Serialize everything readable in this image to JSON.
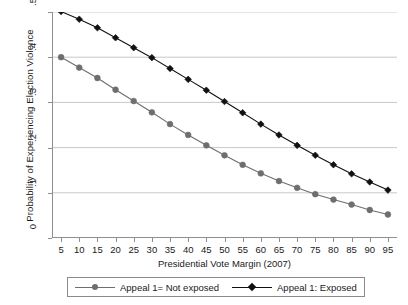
{
  "chart_data": {
    "type": "line",
    "title": "",
    "xlabel": "Presidential Vote Margin (2007)",
    "ylabel": "Probability of Experiencing Election Violence",
    "x": [
      5,
      10,
      15,
      20,
      25,
      30,
      35,
      40,
      45,
      50,
      55,
      60,
      65,
      70,
      75,
      80,
      85,
      90,
      95
    ],
    "xlim": [
      2.5,
      97.5
    ],
    "ylim": [
      0,
      0.5
    ],
    "ytick_labels": [
      "0",
      ".1",
      ".2",
      ".3",
      ".4",
      ".5"
    ],
    "ytick_values": [
      0,
      0.1,
      0.2,
      0.3,
      0.4,
      0.5
    ],
    "xtick_labels": [
      "5",
      "10",
      "15",
      "20",
      "25",
      "30",
      "35",
      "40",
      "45",
      "50",
      "55",
      "60",
      "65",
      "70",
      "75",
      "80",
      "85",
      "90",
      "95"
    ],
    "grid": "horizontal",
    "legend_position": "bottom",
    "series": [
      {
        "name": "Appeal 1= Not exposed",
        "color": "#6e6e6e",
        "marker": "circle",
        "values": [
          0.4,
          0.377,
          0.354,
          0.328,
          0.303,
          0.278,
          0.252,
          0.228,
          0.205,
          0.183,
          0.162,
          0.143,
          0.126,
          0.111,
          0.097,
          0.085,
          0.074,
          0.062,
          0.052
        ]
      },
      {
        "name": "Appeal 1: Exposed",
        "color": "#111111",
        "marker": "diamond",
        "values": [
          0.501,
          0.484,
          0.465,
          0.443,
          0.421,
          0.399,
          0.375,
          0.351,
          0.327,
          0.302,
          0.277,
          0.252,
          0.228,
          0.205,
          0.183,
          0.162,
          0.142,
          0.124,
          0.106
        ]
      }
    ]
  },
  "legend": {
    "entries": [
      {
        "label": "Appeal 1= Not exposed"
      },
      {
        "label": "Appeal 1: Exposed"
      }
    ]
  }
}
